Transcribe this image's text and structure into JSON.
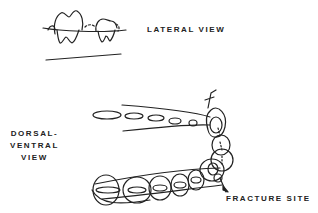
{
  "labels": {
    "lateral_view": "LATERAL VIEW",
    "dorsal_ventral_line1": "DORSAL-",
    "dorsal_ventral_line2": "VENTRAL",
    "dorsal_ventral_line3": "VIEW",
    "fracture_site": "FRACTURE SITE"
  },
  "colors": {
    "ink": "#222222",
    "background": "#ffffff"
  }
}
